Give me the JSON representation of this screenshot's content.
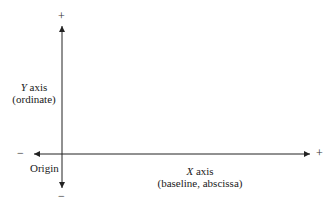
{
  "diagram": {
    "y_axis": {
      "name": "Y",
      "label_suffix": "axis",
      "sublabel": "(ordinate)",
      "positive_sign": "+",
      "negative_sign": "−"
    },
    "x_axis": {
      "name": "X",
      "label_suffix": "axis",
      "sublabel": "(baseline, abscissa)",
      "positive_sign": "+",
      "negative_sign": "−"
    },
    "origin_label": "Origin",
    "line_color": "#222222"
  }
}
